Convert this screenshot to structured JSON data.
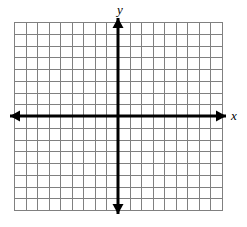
{
  "figure": {
    "kind": "coordinate-plane",
    "background_color": "#ffffff",
    "width": 247,
    "height": 227
  },
  "axis_labels": {
    "y": "y",
    "x": "x"
  },
  "chart_data": {
    "type": "scatter",
    "title": "",
    "subtitle": "",
    "xlabel": "x",
    "ylabel": "y",
    "series": [
      {
        "name": "",
        "x": [],
        "y": []
      }
    ],
    "x": [],
    "values": [],
    "categories": [],
    "xlim": [
      -9,
      9
    ],
    "ylim": [
      -8,
      8
    ],
    "x_tick_labels": [],
    "y_tick_labels": [],
    "x_major_step": 1,
    "y_major_step": 1,
    "grid": true,
    "grid_columns": 18,
    "grid_rows": 16,
    "legend": [],
    "legend_position": "none",
    "annotations": []
  },
  "geometry": {
    "grid_left": 14,
    "grid_top": 22,
    "grid_right": 222,
    "grid_bottom": 210,
    "origin_x": 118,
    "origin_y": 116,
    "cell_width": 11.5555,
    "cell_height": 11.75,
    "columns": 18,
    "rows": 16,
    "axis_arrow_overshoot": 4
  },
  "style": {
    "grid_line_color": "#808080",
    "grid_line_width": 1,
    "grid_border_color": "#808080",
    "axis_color": "#000000",
    "axis_line_width": 3,
    "arrow_color": "#000000",
    "label_color": "#000000"
  }
}
